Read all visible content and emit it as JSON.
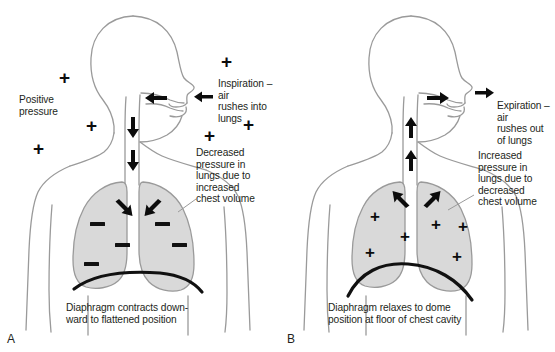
{
  "figure": {
    "type": "anatomy-diagram",
    "panels": [
      {
        "letter": "A",
        "phase": "Inspiration",
        "labels": {
          "positive_pressure": "Positive\npressure",
          "airflow": "Inspiration – air\nrushes into lungs",
          "lung_pressure": "Decreased pressure in\nlungs due to increased\nchest volume",
          "diaphragm": "Diaphragm contracts down-\nward to flattened position"
        },
        "external_plus_count": 7,
        "lung_sign": "minus",
        "lung_sign_count": 6,
        "airway_arrow_direction": "into-lungs",
        "trachea_arrow_direction": "down",
        "bronchi_arrow_direction": "down-outward",
        "diaphragm_shape": "flattened"
      },
      {
        "letter": "B",
        "phase": "Expiration",
        "labels": {
          "airflow": "Expiration – air\nrushes out\nof lungs",
          "lung_pressure": "Increased\npressure in\nlungs due to\ndecreased\nchest volume",
          "diaphragm": "Diaphragm relaxes to dome\nposition at floor of chest cavity"
        },
        "external_plus_count": 0,
        "lung_sign": "plus",
        "lung_sign_count": 6,
        "airway_arrow_direction": "out-of-lungs",
        "trachea_arrow_direction": "up",
        "bronchi_arrow_direction": "up-inward",
        "diaphragm_shape": "domed"
      }
    ],
    "colors": {
      "body_outline": "#9a9a9a",
      "lung_fill": "#d9d9d9",
      "lung_outline": "#9a9a9a",
      "diaphragm": "#111111",
      "symbol": "#0c0c0c",
      "text": "#231f20",
      "background": "#ffffff"
    }
  }
}
